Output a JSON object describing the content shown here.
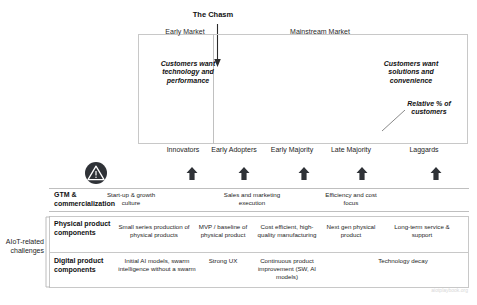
{
  "diagram": {
    "title_chasm": "The Chasm",
    "market_bands": {
      "early": "Early Market",
      "mainstream": "Mainstream Market"
    },
    "callouts": {
      "early_market": "Customers want technology and performance",
      "mainstream_market": "Customers want solutions and convenience",
      "curve_legend": "Relative % of customers"
    },
    "curve_labels": {
      "minimum_feature_set": "Minimum Feature Set",
      "whole_product_solution": "Whole Product / Solution"
    },
    "warning_icon": "warning-triangle-icon",
    "watermark": "aiotplaybook.org"
  },
  "chart_data": {
    "type": "area",
    "xlabel": "",
    "ylabel": "Relative % of customers",
    "grid": false,
    "legend": "none",
    "annotations": [
      "The Chasm",
      "Early Market",
      "Mainstream Market",
      "Customers want technology and performance",
      "Customers want solutions and convenience",
      "Relative % of customers",
      "Minimum Feature Set",
      "Whole Product / Solution"
    ],
    "categories": [
      "Innovators",
      "Early Adopters",
      "Early Majority",
      "Late Majority",
      "Laggards"
    ],
    "values": [
      2.5,
      13.5,
      34,
      34,
      16
    ],
    "segment_colors": [
      "#9d9d9d",
      "#6e6e6e",
      "#8f8f8f",
      "#6e6e6e",
      "#3d4248"
    ],
    "segment_spans": [
      [
        0,
        0.145
      ],
      [
        0.145,
        0.235
      ],
      [
        0.255,
        0.425
      ],
      [
        0.44,
        0.565
      ],
      [
        0.58,
        1.0
      ]
    ]
  },
  "segments": [
    {
      "name": "Innovators",
      "left": 16,
      "width": 58
    },
    {
      "name": "Early Adopters",
      "left": 72,
      "width": 48
    },
    {
      "name": "Early Majority",
      "left": 128,
      "width": 52
    },
    {
      "name": "Late Majority",
      "left": 188,
      "width": 50
    },
    {
      "name": "Laggards",
      "left": 258,
      "width": 56
    }
  ],
  "arrow_positions": [
    48,
    100,
    160,
    218,
    292
  ],
  "rows": {
    "gtm": {
      "label": "GTM & commercialization",
      "cells": [
        {
          "text": "Start-up & growth culture",
          "left": 100,
          "width": 62
        },
        {
          "text": "Sales and marketing execution",
          "left": 215,
          "width": 74
        },
        {
          "text": "Efficiency and cost focus",
          "left": 320,
          "width": 62
        }
      ]
    },
    "physical": {
      "label": "Physical product components",
      "cells": [
        {
          "text": "Small series production of physical products",
          "left": 118,
          "width": 72
        },
        {
          "text": "MVP / baseline of physical product",
          "left": 196,
          "width": 54
        },
        {
          "text": "Cost efficient, high-quality manufacturing",
          "left": 256,
          "width": 62
        },
        {
          "text": "Next gen physical product",
          "left": 326,
          "width": 50
        },
        {
          "text": "Long-term service & support",
          "left": 384,
          "width": 76
        }
      ]
    },
    "digital": {
      "label": "Digital product components",
      "cells": [
        {
          "text": "Initial AI models, swarm intelligence without a swarm",
          "left": 118,
          "width": 78
        },
        {
          "text": "Strong UX",
          "left": 200,
          "width": 46
        },
        {
          "text": "Continuous product improvement (SW, AI models)",
          "left": 252,
          "width": 70
        },
        {
          "text": "Technology decay",
          "left": 372,
          "width": 62
        }
      ]
    }
  },
  "aiot_caption": "AIoT-related challenges"
}
